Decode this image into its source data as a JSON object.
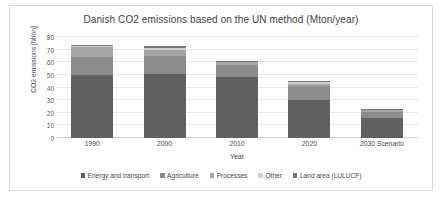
{
  "chart_data": {
    "type": "bar",
    "stacked": true,
    "title": "Danish CO2 emissions based on the UN method (Mton/year)",
    "xlabel": "Year",
    "ylabel": "CO2 emissions [Mton]",
    "categories": [
      "1990",
      "2000",
      "2010",
      "2020",
      "2030 Scenario"
    ],
    "ylim": [
      0,
      80
    ],
    "yticks": [
      0,
      10,
      20,
      30,
      40,
      50,
      60,
      70,
      80
    ],
    "grid": true,
    "legend_position": "bottom",
    "series": [
      {
        "name": "Energy and transport",
        "color": "#606060",
        "values": [
          50,
          51,
          48,
          30,
          16
        ]
      },
      {
        "name": "Agriculture",
        "color": "#8c8c8c",
        "values": [
          14,
          14,
          10,
          11,
          5
        ]
      },
      {
        "name": "Processes",
        "color": "#a6a6a6",
        "values": [
          8,
          5,
          2,
          2,
          1
        ]
      },
      {
        "name": "Other",
        "color": "#d0d0d0",
        "values": [
          1,
          1,
          0.5,
          1,
          0.5
        ]
      },
      {
        "name": "Land area (LULUCF)",
        "color": "#777777",
        "values": [
          1,
          2,
          0.5,
          1,
          0.5
        ]
      }
    ],
    "totals": [
      74,
      73,
      61,
      45,
      23
    ]
  }
}
